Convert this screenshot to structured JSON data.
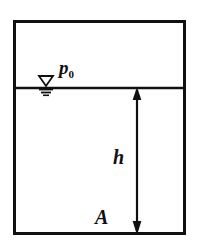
{
  "figure": {
    "type": "physics-diagram",
    "background_color": "#ffffff",
    "stroke_color": "#101010",
    "container": {
      "name": "tank-outline",
      "x": 13,
      "y": 20,
      "width": 173,
      "height": 215,
      "border_width": 3
    },
    "free_surface": {
      "name": "water-surface-line",
      "y": 88,
      "x_start": 13,
      "x_end": 186,
      "line_width": 2
    },
    "surface_symbol": {
      "name": "water-level-triangle",
      "center_x": 46,
      "apex_y": 82,
      "half_width": 7,
      "hatch_lines": 3
    },
    "dimension": {
      "name": "height-dimension-line",
      "x": 137,
      "top_y": 88,
      "bottom_y": 234,
      "arrowheads": "both",
      "line_width": 2
    }
  },
  "labels": {
    "pressure": {
      "symbol": "p",
      "subscript": "0",
      "full": "p0",
      "meaning": "atmospheric-pressure-at-free-surface"
    },
    "depth": {
      "symbol": "h",
      "meaning": "depth-below-free-surface"
    },
    "area": {
      "symbol": "A",
      "meaning": "bottom-area-point"
    }
  }
}
